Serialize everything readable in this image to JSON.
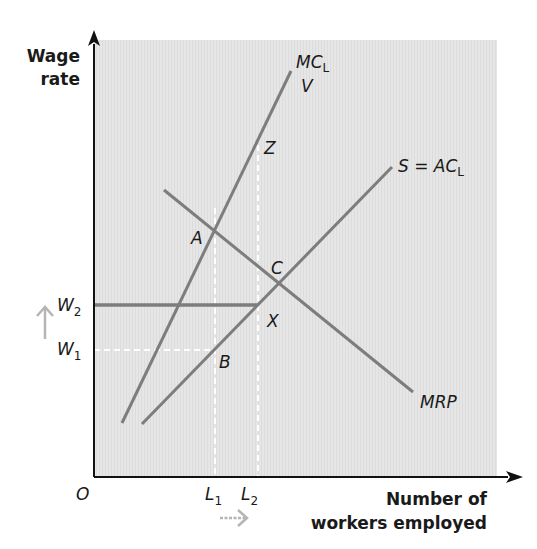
{
  "diagram": {
    "type": "monopsony labour market",
    "y_axis_title_line1": "Wage",
    "y_axis_title_line2": "rate",
    "x_axis_title_line1": "Number of",
    "x_axis_title_line2": "workers employed",
    "origin_label": "O",
    "colors": {
      "plot_background": "#e4e4e4",
      "curve": "#7d7d7d",
      "axis": "#111111",
      "dashed_guides": "#ffffff",
      "shift_arrows": "#b5b5b5",
      "text": "#1a1a1a"
    },
    "curves": [
      {
        "id": "mc-l",
        "label_main": "MC",
        "label_sub": "L",
        "extra_label": "V",
        "from": [
          122,
          423
        ],
        "to": [
          291,
          71
        ]
      },
      {
        "id": "supply-ac-l",
        "label_main": "S = AC",
        "label_sub": "L",
        "from": [
          142,
          424
        ],
        "to": [
          392,
          167
        ]
      },
      {
        "id": "mrp",
        "label_main": "MRP",
        "from": [
          164,
          190
        ],
        "to": [
          413,
          392
        ]
      }
    ],
    "wage_levels": [
      {
        "label_main": "W",
        "label_sub": "1",
        "style": "dashed",
        "y": 350,
        "to_x": 215
      },
      {
        "label_main": "W",
        "label_sub": "2",
        "style": "solid",
        "y": 305,
        "to_x": 258
      }
    ],
    "employment_levels": [
      {
        "label_main": "L",
        "label_sub": "1",
        "style": "dashed",
        "x": 215,
        "from_y": 208
      },
      {
        "label_main": "L",
        "label_sub": "2",
        "style": "dashed",
        "x": 258,
        "from_y": 145
      }
    ],
    "points": [
      {
        "label": "A",
        "x": 215,
        "y": 208
      },
      {
        "label": "B",
        "x": 215,
        "y": 350
      },
      {
        "label": "C",
        "x": 281,
        "y": 283
      },
      {
        "label": "X",
        "x": 258,
        "y": 305
      },
      {
        "label": "Z",
        "x": 258,
        "y": 145
      },
      {
        "label": "V",
        "x": 291,
        "y": 71
      }
    ],
    "annotations": [
      {
        "id": "wage-rise-arrow",
        "direction": "up",
        "meaning": "wage rises from W1 to W2"
      },
      {
        "id": "employment-rise-arrow",
        "direction": "right",
        "meaning": "employment rises from L1 to L2"
      }
    ]
  }
}
